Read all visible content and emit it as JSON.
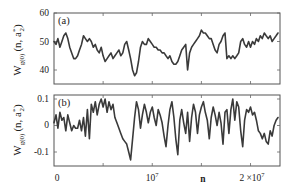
{
  "chart_data": [
    {
      "type": "line",
      "panel_label": "(a)",
      "ylabel": "W_{g^{(0)}}(n, a_2^*)",
      "ylabel_main": "W",
      "ylabel_sub": "g(0)",
      "ylabel_args": "(n, a",
      "ylabel_args_sub": "2",
      "ylabel_args_sup": "*",
      "ylabel_close": ")",
      "xlabel": "",
      "xlim": [
        0,
        23000000.0
      ],
      "ylim": [
        34,
        60
      ],
      "yticks": [
        40,
        50,
        60
      ],
      "ytick_labels": [
        "40",
        "50",
        "60"
      ],
      "x": [
        0,
        200000.0,
        400000.0,
        600000.0,
        800000.0,
        1000000.0,
        1200000.0,
        1400000.0,
        1600000.0,
        1800000.0,
        2000000.0,
        2200000.0,
        2400000.0,
        2600000.0,
        2800000.0,
        3000000.0,
        3200000.0,
        3400000.0,
        3600000.0,
        3800000.0,
        4000000.0,
        4200000.0,
        4400000.0,
        4600000.0,
        4800000.0,
        5000000.0,
        5200000.0,
        5400000.0,
        5600000.0,
        5800000.0,
        6000000.0,
        6200000.0,
        6400000.0,
        6600000.0,
        6800000.0,
        7000000.0,
        7200000.0,
        7400000.0,
        7600000.0,
        7800000.0,
        8000000.0,
        8200000.0,
        8400000.0,
        8600000.0,
        8800000.0,
        9000000.0,
        9200000.0,
        9400000.0,
        9600000.0,
        9800000.0,
        10000000.0,
        10200000.0,
        10400000.0,
        10600000.0,
        10800000.0,
        11000000.0,
        11200000.0,
        11400000.0,
        11600000.0,
        11800000.0,
        12000000.0,
        12200000.0,
        12400000.0,
        12600000.0,
        12800000.0,
        13000000.0,
        13200000.0,
        13400000.0,
        13600000.0,
        13800000.0,
        14000000.0,
        14200000.0,
        14400000.0,
        14600000.0,
        14800000.0,
        15000000.0,
        15200000.0,
        15400000.0,
        15600000.0,
        15800000.0,
        16000000.0,
        16200000.0,
        16400000.0,
        16600000.0,
        16800000.0,
        17000000.0,
        17200000.0,
        17400000.0,
        17600000.0,
        17800000.0,
        18000000.0,
        18200000.0,
        18400000.0,
        18600000.0,
        18800000.0,
        19000000.0,
        19200000.0,
        19400000.0,
        19600000.0,
        19800000.0,
        20000000.0,
        20200000.0,
        20400000.0,
        20600000.0,
        20800000.0,
        21000000.0,
        21200000.0,
        21400000.0,
        21600000.0,
        21800000.0,
        22000000.0,
        22200000.0,
        22400000.0,
        22600000.0,
        22800000.0
      ],
      "y": [
        50,
        49,
        51,
        48,
        50,
        52,
        53,
        51,
        48,
        46,
        44,
        44,
        45,
        47,
        49,
        52,
        51,
        50,
        51,
        50,
        48,
        49,
        47,
        46,
        48,
        45,
        43,
        44,
        45,
        46,
        44,
        45,
        46,
        47,
        45,
        46,
        49,
        50,
        47,
        44,
        40,
        38,
        39,
        43,
        48,
        50,
        49,
        49,
        51,
        50,
        49,
        48,
        48,
        47,
        47,
        46,
        46,
        45,
        44,
        45,
        43,
        42,
        42,
        43,
        45,
        47,
        48,
        49,
        40,
        46,
        48,
        49,
        50,
        51,
        52,
        54,
        53,
        53,
        52,
        51,
        51,
        49,
        47,
        46,
        49,
        50,
        52,
        53,
        44,
        45,
        44,
        45,
        44,
        45,
        46,
        50,
        51,
        49,
        48,
        50,
        48,
        50,
        49,
        51,
        50,
        52,
        51,
        53,
        52,
        51,
        52,
        50,
        51,
        52,
        53
      ],
      "grid": false,
      "legend": "none"
    },
    {
      "type": "line",
      "panel_label": "(b)",
      "ylabel": "W_{g^{(0)}}(n, a_2^*)",
      "ylabel_main": "W",
      "ylabel_sub": "g(0)",
      "ylabel_args": "(n, a",
      "ylabel_args_sub": "2",
      "ylabel_args_sup": "*",
      "ylabel_close": ")",
      "xlabel": "n",
      "xlim": [
        0,
        23000000.0
      ],
      "ylim": [
        -0.155,
        0.115
      ],
      "yticks": [
        -0.1,
        0,
        0.1
      ],
      "ytick_labels": [
        "-0.1",
        "0",
        "0.1"
      ],
      "xticks": [
        0,
        10000000.0,
        20000000.0
      ],
      "xtick_labels": [
        "0",
        "10^7",
        "2×10^7"
      ],
      "xtick_label_0": "0",
      "xtick_label_1_base": "10",
      "xtick_label_1_exp": "7",
      "xtick_label_2_base": "2 ×10",
      "xtick_label_2_exp": "7",
      "x": [
        0,
        200000.0,
        400000.0,
        600000.0,
        800000.0,
        1000000.0,
        1200000.0,
        1400000.0,
        1600000.0,
        1800000.0,
        2000000.0,
        2200000.0,
        2400000.0,
        2600000.0,
        2800000.0,
        3000000.0,
        3200000.0,
        3400000.0,
        3600000.0,
        3800000.0,
        4000000.0,
        4200000.0,
        4400000.0,
        4600000.0,
        4800000.0,
        5000000.0,
        5200000.0,
        5400000.0,
        5600000.0,
        5800000.0,
        6000000.0,
        6200000.0,
        6400000.0,
        6600000.0,
        6800000.0,
        7000000.0,
        7200000.0,
        7400000.0,
        7600000.0,
        7800000.0,
        8000000.0,
        8200000.0,
        8400000.0,
        8600000.0,
        8800000.0,
        9000000.0,
        9200000.0,
        9400000.0,
        9600000.0,
        9800000.0,
        10000000.0,
        10200000.0,
        10400000.0,
        10600000.0,
        10800000.0,
        11000000.0,
        11200000.0,
        11400000.0,
        11600000.0,
        11800000.0,
        12000000.0,
        12200000.0,
        12400000.0,
        12600000.0,
        12800000.0,
        13000000.0,
        13200000.0,
        13400000.0,
        13600000.0,
        13800000.0,
        14000000.0,
        14200000.0,
        14400000.0,
        14600000.0,
        14800000.0,
        15000000.0,
        15200000.0,
        15400000.0,
        15600000.0,
        15800000.0,
        16000000.0,
        16200000.0,
        16400000.0,
        16600000.0,
        16800000.0,
        17000000.0,
        17200000.0,
        17400000.0,
        17600000.0,
        17800000.0,
        18000000.0,
        18200000.0,
        18400000.0,
        18600000.0,
        18800000.0,
        19000000.0,
        19200000.0,
        19400000.0,
        19600000.0,
        19800000.0,
        20000000.0,
        20200000.0,
        20400000.0,
        20600000.0,
        20800000.0,
        21000000.0,
        21200000.0,
        21400000.0,
        21600000.0,
        21800000.0,
        22000000.0,
        22200000.0,
        22400000.0,
        22600000.0,
        22800000.0
      ],
      "y": [
        0.01,
        0.04,
        -0.01,
        0.05,
        0.02,
        0.03,
        -0.02,
        0.04,
        0.01,
        -0.02,
        0.0,
        -0.01,
        -0.01,
        0.02,
        -0.02,
        0.03,
        -0.04,
        0.06,
        -0.05,
        0.08,
        0.05,
        0.09,
        0.04,
        0.08,
        0.1,
        0.07,
        0.1,
        0.05,
        0.09,
        0.06,
        0.08,
        0.03,
        0.01,
        -0.01,
        -0.03,
        -0.05,
        -0.06,
        -0.07,
        -0.1,
        -0.13,
        -0.05,
        0.03,
        0.09,
        0.06,
        -0.01,
        0.04,
        0.08,
        0.05,
        0.01,
        0.05,
        0.07,
        0.03,
        0.0,
        0.06,
        0.04,
        0.01,
        -0.04,
        -0.08,
        0.0,
        0.06,
        0.09,
        0.03,
        -0.05,
        -0.11,
        0.02,
        0.06,
        0.01,
        -0.03,
        0.05,
        -0.06,
        0.03,
        0.08,
        0.05,
        -0.03,
        0.04,
        0.07,
        0.09,
        0.05,
        0.02,
        -0.05,
        0.03,
        0.07,
        0.04,
        0.0,
        0.05,
        0.01,
        -0.07,
        0.05,
        0.06,
        -0.03,
        0.06,
        0.1,
        0.02,
        0.09,
        0.07,
        -0.02,
        -0.08,
        0.02,
        0.06,
        0.05,
        0.07,
        0.04,
        0.05,
        0.02,
        -0.02,
        -0.03,
        -0.05,
        -0.03,
        -0.06,
        -0.07,
        -0.02,
        -0.04,
        0.0,
        0.02,
        0.03
      ],
      "grid": false,
      "legend": "none"
    }
  ]
}
